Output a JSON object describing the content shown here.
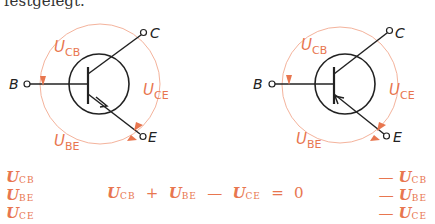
{
  "header": {
    "text": "festgelegt."
  },
  "colors": {
    "accent": "#e8764f",
    "line": "#222222",
    "arc": "#f0a58a"
  },
  "diagrams": [
    {
      "type": "npn",
      "terminals": {
        "base": "B",
        "collector": "C",
        "emitter": "E"
      },
      "voltages": {
        "cb": {
          "main": "U",
          "sub": "CB"
        },
        "ce": {
          "main": "U",
          "sub": "CE"
        },
        "be": {
          "main": "U",
          "sub": "BE"
        }
      }
    },
    {
      "type": "pnp",
      "terminals": {
        "base": "B",
        "collector": "C",
        "emitter": "E"
      },
      "voltages": {
        "cb": {
          "main": "U",
          "sub": "CB"
        },
        "ce": {
          "main": "U",
          "sub": "CE"
        },
        "be": {
          "main": "U",
          "sub": "BE"
        }
      }
    }
  ],
  "equations": {
    "left_column": [
      {
        "main": "U",
        "sub": "CB"
      },
      {
        "main": "U",
        "sub": "BE"
      },
      {
        "main": "U",
        "sub": "CE"
      }
    ],
    "main": {
      "t1": {
        "main": "U",
        "sub": "CB"
      },
      "op1": "+",
      "t2": {
        "main": "U",
        "sub": "BE"
      },
      "op2": "—",
      "t3": {
        "main": "U",
        "sub": "CE"
      },
      "op3": "=",
      "rhs": "0"
    },
    "right_column": [
      {
        "sign": "—",
        "main": "U",
        "sub": "CB"
      },
      {
        "sign": "—",
        "main": "U",
        "sub": "BE"
      },
      {
        "sign": "—",
        "main": "U",
        "sub": "CE"
      }
    ]
  }
}
